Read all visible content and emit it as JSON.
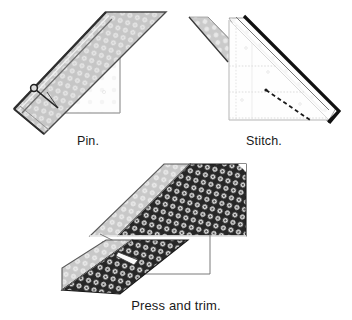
{
  "document": {
    "type": "sewing-instruction-diagram",
    "title": "Binding strip joining steps"
  },
  "panels": [
    {
      "id": "pin",
      "caption": "Pin.",
      "step_number": 1,
      "description": "Two fabric strips overlapped at a right angle with a pin placed across the diagonal seam line.",
      "elements": {
        "pin_marker": "pin-icon",
        "seam_line": "diagonal-guide-line",
        "strips": [
          {
            "name": "upper-strip",
            "fabric": "light-dotted",
            "orientation": "diagonal-up-right"
          },
          {
            "name": "lower-strip",
            "fabric": "white-backing",
            "orientation": "horizontal-under"
          }
        ]
      }
    },
    {
      "id": "stitch",
      "caption": "Stitch.",
      "step_number": 2,
      "description": "The two strips pinned at the corner with a dashed stitching line sewn across the diagonal.",
      "elements": {
        "stitch_line": "dashed-stitch-line",
        "fold_edge": "dark-fold-edge",
        "strips": [
          {
            "name": "folded-strip",
            "fabric": "white-backing",
            "orientation": "diagonal-down-right"
          },
          {
            "name": "under-strip",
            "fabric": "light-dotted",
            "orientation": "diagonal-up-left"
          }
        ]
      }
    },
    {
      "id": "press",
      "caption": "Press and trim.",
      "step_number": 3,
      "description": "The joined strips pressed open, showing a light dotted fabric strip joined to a dark dotted fabric strip, with the excess seam allowance trimmed.",
      "elements": {
        "seam_marker": "trimmed-seam-line",
        "strips": [
          {
            "name": "light-strip",
            "fabric": "light-dotted"
          },
          {
            "name": "dark-strip",
            "fabric": "dark-dotted"
          }
        ]
      }
    }
  ],
  "colors": {
    "background": "#ffffff",
    "ink": "#1a1a1a",
    "light_fabric": "#c9c9c9",
    "light_fabric_motif": "#e8e8e8",
    "dark_fabric": "#2b2b2b",
    "dark_fabric_motif": "#e0e0e0",
    "backing_white": "#fdfdfd",
    "guide_line": "#bdbdbd",
    "outline": "#555555"
  }
}
